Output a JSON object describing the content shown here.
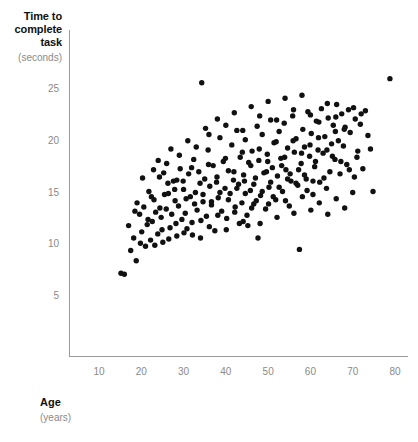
{
  "chart_data": {
    "type": "scatter",
    "title": "",
    "ylabel": "Time to complete task",
    "ylabel_lines": [
      "Time to",
      "complete",
      "task"
    ],
    "yunit": "(seconds)",
    "xlabel": "Age",
    "xunit": "(years)",
    "xlim": [
      7,
      82
    ],
    "ylim": [
      2.5,
      28
    ],
    "xticks": [
      10,
      20,
      30,
      40,
      50,
      60,
      70,
      80
    ],
    "yticks": [
      5,
      10,
      15,
      20,
      25
    ],
    "grid": false,
    "legend": null,
    "marker_color": "#111111",
    "axis_color": "#9a9a9a",
    "tick_color": "#8a8a8a",
    "n_points": 252,
    "points": [
      [
        15.2,
        7.2
      ],
      [
        16.0,
        7.1
      ],
      [
        17.5,
        9.4
      ],
      [
        18.2,
        10.6
      ],
      [
        18.8,
        8.4
      ],
      [
        19.6,
        12.9
      ],
      [
        20.1,
        11.2
      ],
      [
        20.6,
        13.6
      ],
      [
        21.0,
        9.8
      ],
      [
        21.4,
        11.9
      ],
      [
        21.8,
        15.1
      ],
      [
        22.2,
        10.4
      ],
      [
        22.6,
        12.2
      ],
      [
        23.0,
        14.3
      ],
      [
        23.4,
        13.1
      ],
      [
        23.9,
        11.0
      ],
      [
        24.3,
        16.5
      ],
      [
        24.7,
        12.6
      ],
      [
        25.1,
        10.2
      ],
      [
        25.5,
        14.8
      ],
      [
        25.9,
        13.4
      ],
      [
        26.3,
        15.9
      ],
      [
        26.8,
        11.6
      ],
      [
        27.2,
        12.9
      ],
      [
        27.6,
        16.1
      ],
      [
        28.0,
        14.2
      ],
      [
        28.4,
        10.8
      ],
      [
        28.8,
        13.7
      ],
      [
        29.2,
        17.3
      ],
      [
        29.6,
        12.4
      ],
      [
        30.0,
        15.3
      ],
      [
        30.4,
        13.0
      ],
      [
        30.8,
        11.5
      ],
      [
        31.2,
        16.8
      ],
      [
        31.6,
        14.6
      ],
      [
        32.0,
        12.1
      ],
      [
        32.4,
        18.2
      ],
      [
        32.8,
        15.0
      ],
      [
        33.2,
        13.3
      ],
      [
        33.6,
        17.0
      ],
      [
        34.0,
        10.6
      ],
      [
        34.3,
        25.6
      ],
      [
        34.6,
        14.1
      ],
      [
        35.0,
        16.3
      ],
      [
        35.4,
        12.7
      ],
      [
        35.8,
        19.1
      ],
      [
        36.2,
        15.6
      ],
      [
        36.6,
        13.8
      ],
      [
        37.0,
        17.6
      ],
      [
        37.4,
        11.3
      ],
      [
        37.8,
        16.0
      ],
      [
        38.2,
        14.5
      ],
      [
        38.6,
        20.3
      ],
      [
        39.0,
        13.2
      ],
      [
        39.4,
        18.0
      ],
      [
        39.8,
        15.4
      ],
      [
        40.2,
        12.5
      ],
      [
        40.6,
        17.1
      ],
      [
        41.0,
        14.9
      ],
      [
        41.4,
        19.6
      ],
      [
        41.8,
        16.2
      ],
      [
        42.2,
        13.6
      ],
      [
        42.6,
        21.0
      ],
      [
        43.0,
        15.8
      ],
      [
        43.4,
        18.4
      ],
      [
        43.8,
        14.0
      ],
      [
        44.2,
        16.7
      ],
      [
        44.6,
        20.1
      ],
      [
        45.0,
        12.8
      ],
      [
        45.4,
        17.9
      ],
      [
        45.8,
        15.2
      ],
      [
        46.2,
        19.0
      ],
      [
        46.6,
        13.9
      ],
      [
        47.0,
        16.4
      ],
      [
        47.4,
        21.4
      ],
      [
        47.8,
        18.1
      ],
      [
        48.2,
        14.7
      ],
      [
        48.6,
        20.6
      ],
      [
        49.0,
        16.9
      ],
      [
        49.4,
        13.4
      ],
      [
        49.8,
        18.7
      ],
      [
        50.2,
        15.5
      ],
      [
        50.6,
        22.0
      ],
      [
        51.0,
        17.4
      ],
      [
        51.4,
        19.8
      ],
      [
        51.8,
        14.3
      ],
      [
        52.2,
        16.6
      ],
      [
        52.6,
        20.9
      ],
      [
        53.0,
        18.3
      ],
      [
        53.4,
        15.1
      ],
      [
        53.8,
        21.7
      ],
      [
        54.2,
        17.2
      ],
      [
        54.6,
        19.3
      ],
      [
        55.0,
        13.7
      ],
      [
        55.4,
        16.1
      ],
      [
        55.8,
        22.4
      ],
      [
        56.2,
        18.9
      ],
      [
        56.6,
        20.2
      ],
      [
        57.0,
        15.7
      ],
      [
        57.4,
        9.5
      ],
      [
        57.8,
        17.8
      ],
      [
        58.2,
        21.1
      ],
      [
        58.6,
        19.4
      ],
      [
        59.0,
        16.3
      ],
      [
        59.4,
        22.8
      ],
      [
        59.8,
        18.5
      ],
      [
        60.2,
        20.7
      ],
      [
        60.6,
        14.8
      ],
      [
        61.0,
        17.5
      ],
      [
        61.4,
        21.9
      ],
      [
        61.8,
        19.1
      ],
      [
        62.2,
        16.0
      ],
      [
        62.6,
        23.1
      ],
      [
        63.0,
        18.8
      ],
      [
        63.4,
        20.4
      ],
      [
        63.8,
        15.4
      ],
      [
        64.2,
        22.2
      ],
      [
        64.6,
        17.0
      ],
      [
        65.0,
        19.7
      ],
      [
        65.4,
        21.5
      ],
      [
        65.8,
        18.2
      ],
      [
        66.2,
        23.5
      ],
      [
        66.6,
        20.0
      ],
      [
        67.0,
        16.8
      ],
      [
        67.4,
        22.6
      ],
      [
        67.8,
        19.5
      ],
      [
        68.2,
        21.3
      ],
      [
        68.6,
        17.7
      ],
      [
        69.0,
        23.0
      ],
      [
        69.4,
        20.8
      ],
      [
        70.0,
        15.0
      ],
      [
        70.6,
        22.1
      ],
      [
        71.2,
        19.0
      ],
      [
        71.8,
        21.6
      ],
      [
        72.4,
        17.3
      ],
      [
        73.0,
        22.9
      ],
      [
        73.6,
        20.5
      ],
      [
        74.2,
        19.2
      ],
      [
        74.8,
        15.1
      ],
      [
        78.8,
        26.0
      ],
      [
        19.0,
        14.0
      ],
      [
        20.3,
        16.4
      ],
      [
        22.9,
        17.2
      ],
      [
        24.0,
        18.1
      ],
      [
        26.0,
        17.8
      ],
      [
        27.0,
        19.2
      ],
      [
        29.0,
        18.6
      ],
      [
        31.0,
        20.0
      ],
      [
        33.0,
        19.4
      ],
      [
        35.2,
        21.2
      ],
      [
        36.0,
        20.6
      ],
      [
        38.0,
        22.1
      ],
      [
        40.0,
        21.5
      ],
      [
        42.0,
        22.7
      ],
      [
        44.0,
        21.0
      ],
      [
        46.0,
        23.3
      ],
      [
        48.0,
        22.4
      ],
      [
        50.0,
        23.8
      ],
      [
        52.0,
        22.0
      ],
      [
        54.0,
        24.1
      ],
      [
        56.0,
        23.0
      ],
      [
        58.0,
        24.4
      ],
      [
        60.0,
        22.5
      ],
      [
        62.0,
        21.8
      ],
      [
        64.0,
        23.6
      ],
      [
        66.0,
        22.3
      ],
      [
        68.0,
        21.1
      ],
      [
        70.2,
        23.2
      ],
      [
        72.0,
        22.6
      ],
      [
        17.0,
        11.8
      ],
      [
        18.5,
        13.2
      ],
      [
        19.8,
        10.1
      ],
      [
        21.6,
        12.4
      ],
      [
        23.2,
        9.9
      ],
      [
        24.9,
        11.4
      ],
      [
        26.5,
        10.5
      ],
      [
        28.2,
        12.0
      ],
      [
        30.1,
        11.1
      ],
      [
        32.1,
        10.9
      ],
      [
        34.1,
        12.3
      ],
      [
        36.1,
        11.7
      ],
      [
        38.1,
        12.8
      ],
      [
        40.1,
        11.4
      ],
      [
        42.1,
        13.1
      ],
      [
        44.1,
        12.2
      ],
      [
        46.1,
        13.5
      ],
      [
        48.1,
        12.0
      ],
      [
        50.1,
        13.9
      ],
      [
        52.1,
        12.6
      ],
      [
        54.1,
        14.2
      ],
      [
        56.1,
        13.0
      ],
      [
        58.1,
        14.6
      ],
      [
        60.1,
        13.3
      ],
      [
        62.1,
        14.0
      ],
      [
        64.1,
        12.9
      ],
      [
        66.1,
        14.4
      ],
      [
        68.1,
        13.5
      ],
      [
        70.4,
        16.5
      ],
      [
        25.3,
        16.9
      ],
      [
        27.9,
        15.3
      ],
      [
        29.9,
        16.1
      ],
      [
        31.9,
        17.4
      ],
      [
        33.9,
        15.9
      ],
      [
        35.9,
        17.7
      ],
      [
        37.9,
        16.5
      ],
      [
        39.9,
        18.3
      ],
      [
        41.9,
        17.0
      ],
      [
        43.9,
        18.9
      ],
      [
        45.9,
        17.6
      ],
      [
        47.9,
        19.2
      ],
      [
        49.9,
        18.0
      ],
      [
        51.9,
        19.9
      ],
      [
        53.9,
        18.4
      ],
      [
        55.9,
        20.0
      ],
      [
        57.9,
        18.8
      ],
      [
        59.9,
        19.6
      ],
      [
        61.9,
        20.3
      ],
      [
        63.9,
        19.1
      ],
      [
        65.9,
        20.9
      ],
      [
        30.6,
        14.4
      ],
      [
        32.6,
        13.9
      ],
      [
        34.6,
        14.8
      ],
      [
        36.6,
        14.1
      ],
      [
        38.6,
        15.0
      ],
      [
        40.6,
        14.3
      ],
      [
        42.6,
        15.4
      ],
      [
        44.6,
        14.9
      ],
      [
        46.6,
        15.8
      ],
      [
        48.6,
        15.1
      ],
      [
        50.6,
        16.0
      ],
      [
        52.6,
        15.5
      ],
      [
        54.6,
        16.3
      ],
      [
        56.6,
        15.9
      ],
      [
        58.6,
        16.7
      ],
      [
        60.6,
        16.1
      ],
      [
        22.4,
        14.6
      ],
      [
        24.4,
        13.5
      ],
      [
        26.4,
        14.9
      ],
      [
        28.4,
        16.2
      ],
      [
        44.4,
        16.1
      ],
      [
        47.2,
        14.2
      ],
      [
        49.6,
        17.0
      ],
      [
        51.2,
        14.6
      ],
      [
        53.2,
        17.6
      ],
      [
        55.2,
        16.8
      ],
      [
        57.2,
        17.2
      ],
      [
        59.2,
        15.2
      ],
      [
        61.2,
        18.0
      ],
      [
        63.2,
        16.4
      ],
      [
        65.2,
        18.5
      ],
      [
        67.2,
        18.0
      ],
      [
        69.2,
        17.2
      ],
      [
        71.0,
        18.4
      ],
      [
        43.2,
        12.0
      ],
      [
        45.2,
        11.8
      ],
      [
        47.6,
        10.6
      ]
    ]
  }
}
